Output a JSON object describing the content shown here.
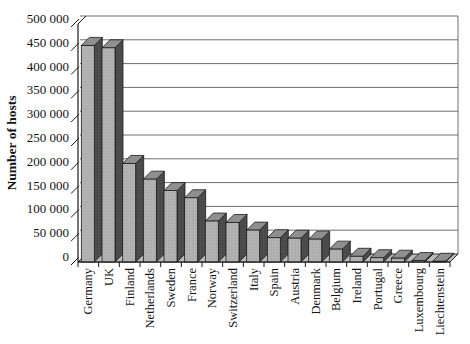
{
  "chart_data": {
    "type": "bar",
    "style": "3d-column",
    "title": "",
    "xlabel": "",
    "ylabel": "Number of hosts",
    "categories": [
      "Germany",
      "UK",
      "Finland",
      "Netherlands",
      "Sweden",
      "France",
      "Norway",
      "Switzerland",
      "Italy",
      "Spain",
      "Austria",
      "Denmark",
      "Belgium",
      "Ireland",
      "Portugal",
      "Greece",
      "Luxembourg",
      "Liechtenstein"
    ],
    "values": [
      455000,
      450000,
      207000,
      174000,
      150000,
      135000,
      86000,
      83000,
      67000,
      51000,
      50000,
      48000,
      27000,
      12000,
      9000,
      8000,
      3000,
      1500
    ],
    "ylim": [
      0,
      500000
    ],
    "ytick_step": 50000,
    "yticks": [
      0,
      50000,
      100000,
      150000,
      200000,
      250000,
      300000,
      350000,
      400000,
      450000,
      500000
    ],
    "ytick_labels": [
      "0",
      "50 000",
      "100 000",
      "150 000",
      "200 000",
      "250 000",
      "300 000",
      "350 000",
      "400 000",
      "450 000",
      "500 000"
    ],
    "grid": true,
    "legend": "none",
    "colors": {
      "background": "#ffffff",
      "bar_front": "#b4b4b4",
      "bar_top": "#8f8f8f",
      "bar_side": "#4e4e4e",
      "floor": "#bdbdbd",
      "gridline": "#6e6e6e",
      "axis": "#1c1c1c",
      "text": "#141414"
    }
  }
}
